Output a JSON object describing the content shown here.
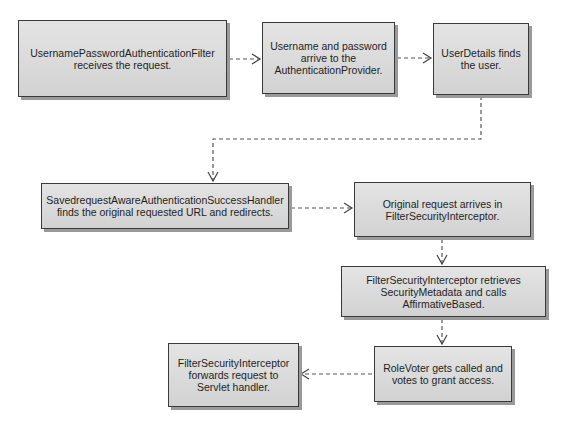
{
  "diagram": {
    "type": "flowchart",
    "nodes": [
      {
        "id": "n1",
        "text": "UsernamePasswordAuthenticationFilter receives the request."
      },
      {
        "id": "n2",
        "text": "Username and password arrive to the AuthenticationProvider."
      },
      {
        "id": "n3",
        "text": "UserDetails finds the user."
      },
      {
        "id": "n4",
        "text": "SavedrequestAwareAuthenticationSuccessHandler finds the original requested URL and redirects."
      },
      {
        "id": "n5",
        "text": "Original request arrives in FilterSecurityInterceptor."
      },
      {
        "id": "n6",
        "text": "FilterSecurityInterceptor retrieves SecurityMetadata and calls AffirmativeBased."
      },
      {
        "id": "n7",
        "text": "RoleVoter gets called and votes to grant access."
      },
      {
        "id": "n8",
        "text": "FilterSecurityInterceptor forwards request to Servlet handler."
      }
    ],
    "edges": [
      {
        "from": "n1",
        "to": "n2",
        "style": "dashed"
      },
      {
        "from": "n2",
        "to": "n3",
        "style": "dashed"
      },
      {
        "from": "n3",
        "to": "n4",
        "style": "dashed"
      },
      {
        "from": "n4",
        "to": "n5",
        "style": "dashed"
      },
      {
        "from": "n5",
        "to": "n6",
        "style": "dashed"
      },
      {
        "from": "n6",
        "to": "n7",
        "style": "dashed"
      },
      {
        "from": "n7",
        "to": "n8",
        "style": "dashed"
      }
    ],
    "colors": {
      "node_fill": "#dcdcdc",
      "node_border": "#3a3a3a",
      "edge": "#555555",
      "background": "#ffffff"
    }
  }
}
